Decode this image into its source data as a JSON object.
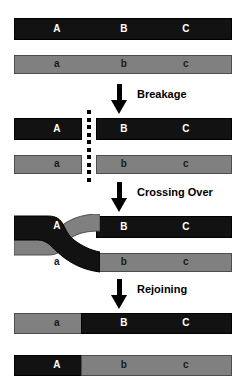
{
  "diagram": {
    "colors": {
      "black_chromatid": "#121212",
      "gray_chromatid": "#808080",
      "gray_border": "#4d4d4d",
      "background": "#ffffff",
      "label_on_black": "#ffffff",
      "label_on_gray": "#1a1a1a",
      "arrow": "#000000"
    },
    "gene_labels": {
      "upper_a": "A",
      "upper_b": "B",
      "upper_c": "C",
      "lower_a": "a",
      "lower_b": "b",
      "lower_c": "c"
    },
    "steps": [
      {
        "id": "breakage",
        "label": "Breakage"
      },
      {
        "id": "crossing-over",
        "label": "Crossing Over"
      },
      {
        "id": "rejoining",
        "label": "Rejoining"
      }
    ],
    "stages": [
      {
        "id": "stage-initial",
        "name": "Paired homologous chromosomes",
        "rows": [
          {
            "id": "row-black-initial",
            "color": "black",
            "segments": [
              {
                "label": "A",
                "color": "black"
              },
              {
                "label": "B",
                "color": "black"
              },
              {
                "label": "C",
                "color": "black"
              }
            ]
          },
          {
            "id": "row-gray-initial",
            "color": "gray",
            "segments": [
              {
                "label": "a",
                "color": "gray"
              },
              {
                "label": "b",
                "color": "gray"
              },
              {
                "label": "c",
                "color": "gray"
              }
            ]
          }
        ]
      },
      {
        "id": "stage-breakage",
        "name": "Chromatids broken at a common point",
        "rows": [
          {
            "id": "row-black-broken",
            "color": "black",
            "segments": [
              {
                "label": "A",
                "color": "black"
              },
              {
                "label": "B",
                "color": "black"
              },
              {
                "label": "C",
                "color": "black"
              }
            ]
          },
          {
            "id": "row-gray-broken",
            "color": "gray",
            "segments": [
              {
                "label": "a",
                "color": "gray"
              },
              {
                "label": "b",
                "color": "gray"
              },
              {
                "label": "c",
                "color": "gray"
              }
            ]
          }
        ]
      },
      {
        "id": "stage-crossing-over",
        "name": "Chromatids cross over and exchange arms",
        "rows": [
          {
            "id": "row-black-crossing",
            "color": "black",
            "segments": [
              {
                "label": "A",
                "color": "black"
              },
              {
                "label": "B",
                "color": "black"
              },
              {
                "label": "C",
                "color": "black"
              }
            ]
          },
          {
            "id": "row-gray-crossing",
            "color": "gray",
            "segments": [
              {
                "label": "a",
                "color": "gray"
              },
              {
                "label": "b",
                "color": "gray"
              },
              {
                "label": "c",
                "color": "gray"
              }
            ]
          }
        ]
      },
      {
        "id": "stage-recombinant",
        "name": "Recombinant chromosomes after rejoining",
        "rows": [
          {
            "id": "row-recombinant-top",
            "color": "mixed",
            "segments": [
              {
                "label": "a",
                "color": "gray"
              },
              {
                "label": "B",
                "color": "black"
              },
              {
                "label": "C",
                "color": "black"
              }
            ]
          },
          {
            "id": "row-recombinant-bottom",
            "color": "mixed",
            "segments": [
              {
                "label": "A",
                "color": "black"
              },
              {
                "label": "b",
                "color": "gray"
              },
              {
                "label": "c",
                "color": "gray"
              }
            ]
          }
        ]
      }
    ]
  }
}
